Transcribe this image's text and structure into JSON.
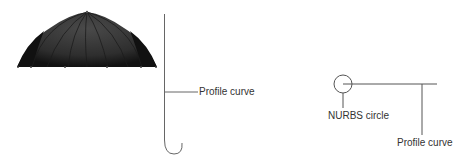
{
  "diagram": {
    "left": {
      "object": "umbrella-rendered",
      "profile_label": "Profile curve"
    },
    "right": {
      "circle_label": "NURBS circle",
      "profile_label": "Profile curve"
    },
    "colors": {
      "line": "#555555",
      "umbrella_dark": "#1a1a1a",
      "umbrella_mid": "#3a3a3a",
      "text": "#333333"
    }
  }
}
